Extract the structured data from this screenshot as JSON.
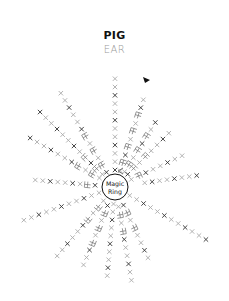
{
  "title": "PIG",
  "subtitle": "EAR",
  "center_label_line1": "Magic",
  "center_label_line2": "Ring",
  "colors": {
    "title": "#111111",
    "subtitle": "#9a9a9a",
    "stitch_dark": "#333333",
    "stitch_light": "#aaaaaa",
    "ring": "#111111"
  },
  "diagram": {
    "type": "crochet-chart",
    "center": [
      115,
      187
    ],
    "ring_radius": 13,
    "symbols": {
      "single_crochet": "×",
      "increase": "V-shape bracket",
      "start_marker": "black triangle"
    }
  }
}
